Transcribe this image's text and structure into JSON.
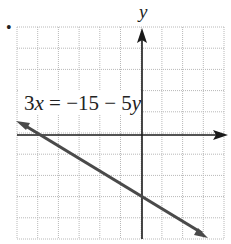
{
  "bullet": "•",
  "axis_labels": {
    "y": "y",
    "x": ""
  },
  "equation_label": "3x = −15 − 5y",
  "equation_parts": {
    "coef": "3",
    "var_x": "x",
    "rest": " = −15 − 5",
    "var_y": "y"
  },
  "grid": {
    "x_min": -6,
    "x_max": 4,
    "y_min": -5,
    "y_max": 5,
    "cols": 10,
    "rows": 10,
    "grid_color": "#b8b8b8",
    "axis_color": "#1a1a1a",
    "line_color": "#4a4a4a"
  },
  "chart_data": {
    "type": "line",
    "title": "",
    "xlabel": "",
    "ylabel": "y",
    "equation": "3x = −15 − 5y",
    "xlim": [
      -6,
      4
    ],
    "ylim": [
      -5,
      5
    ],
    "grid": true,
    "series": [
      {
        "name": "3x = −15 − 5y",
        "x": [
          -6,
          -5,
          0,
          3
        ],
        "y": [
          0.6,
          0,
          -3,
          -4.8
        ]
      }
    ],
    "intercepts": {
      "x_intercept": [
        -5,
        0
      ],
      "y_intercept": [
        0,
        -3
      ]
    },
    "slope": -0.6
  }
}
